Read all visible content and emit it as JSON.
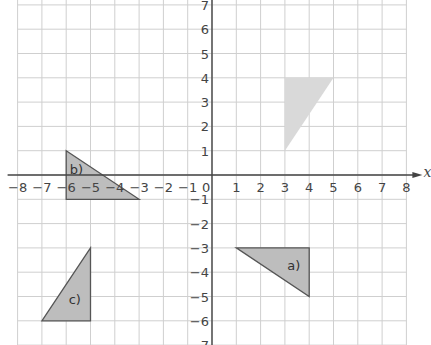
{
  "diagram": {
    "type": "coordinate-grid",
    "x_axis": {
      "label": "x",
      "min": -8,
      "max": 8,
      "ticks": [
        "-8",
        "-7",
        "-6",
        "-5",
        "-4",
        "-3",
        "-2",
        "-1",
        "0",
        "1",
        "2",
        "3",
        "4",
        "5",
        "6",
        "7",
        "8"
      ]
    },
    "y_axis": {
      "min": -7,
      "max": 7,
      "ticks": [
        "7",
        "6",
        "5",
        "4",
        "3",
        "2",
        "1",
        "-1",
        "-2",
        "-3",
        "-4",
        "-5",
        "-6",
        "-7"
      ]
    },
    "colors": {
      "grid": "#cfcfcf",
      "axis": "#444444",
      "shape_fill": "#bdbdbd",
      "shape_stroke": "#555555",
      "object_fill": "#d9d9d9"
    },
    "object": {
      "name": "object-triangle",
      "vertices": [
        [
          3,
          4
        ],
        [
          5,
          4
        ],
        [
          3,
          1
        ]
      ]
    },
    "shapes": [
      {
        "label": "a)",
        "vertices": [
          [
            1,
            -3
          ],
          [
            4,
            -3
          ],
          [
            4,
            -5
          ]
        ],
        "label_pos": [
          3.1,
          -3.9
        ]
      },
      {
        "label": "b)",
        "vertices": [
          [
            -6,
            1
          ],
          [
            -3,
            -1
          ],
          [
            -6,
            -1
          ]
        ],
        "label_pos": [
          -5.85,
          0.05
        ]
      },
      {
        "label": "c)",
        "vertices": [
          [
            -5,
            -3
          ],
          [
            -5,
            -6
          ],
          [
            -7,
            -6
          ]
        ],
        "label_pos": [
          -5.9,
          -5.3
        ]
      }
    ]
  }
}
